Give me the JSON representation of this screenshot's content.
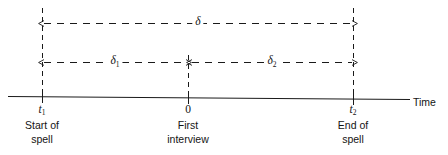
{
  "figure": {
    "type": "timeline-diagram",
    "axis": {
      "name": "Time",
      "orientation": "horizontal"
    },
    "points": [
      {
        "id": "spell-start",
        "tick_label": "t",
        "tick_sub": "1",
        "caption_line1": "Start of",
        "caption_line2": "spell",
        "x": 42
      },
      {
        "id": "first-interview",
        "tick_label": "0",
        "tick_sub": "",
        "caption_line1": "First",
        "caption_line2": "interview",
        "x": 188
      },
      {
        "id": "spell-end",
        "tick_label": "t",
        "tick_sub": "2",
        "caption_line1": "End of",
        "caption_line2": "spell",
        "x": 353
      }
    ],
    "intervals": [
      {
        "id": "delta-total",
        "symbol": "δ",
        "sub": "",
        "from": "spell-start",
        "to": "spell-end",
        "row": 1
      },
      {
        "id": "delta-one",
        "symbol": "δ",
        "sub": "1",
        "from": "spell-start",
        "to": "first-interview",
        "row": 2
      },
      {
        "id": "delta-two",
        "symbol": "δ",
        "sub": "2",
        "from": "first-interview",
        "to": "spell-end",
        "row": 2
      }
    ],
    "colors": {
      "line": "#1a1a1a",
      "background": "#ffffff"
    }
  }
}
